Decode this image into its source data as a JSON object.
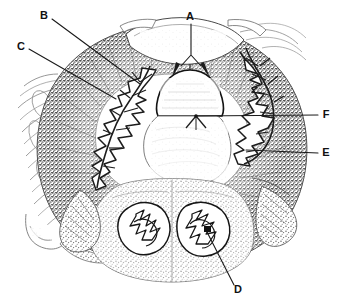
{
  "figure": {
    "kind": "labeled-histology-cross-section",
    "width": 344,
    "height": 308,
    "background_color": "#ffffff",
    "ink_color": "#1a1a1a",
    "caption": ""
  },
  "labels": [
    {
      "id": "A",
      "text": "A",
      "text_x": 190,
      "text_y": 17,
      "leader": "M191,24 L191,55 M191,55 L181,66 M191,55 L201,66",
      "points_to": "upper-midline-paired-structures"
    },
    {
      "id": "B",
      "text": "B",
      "text_x": 44,
      "text_y": 16,
      "leader": "M52,19 L140,84",
      "points_to": "left-branching-gland-upper"
    },
    {
      "id": "C",
      "text": "C",
      "text_x": 21,
      "text_y": 47,
      "leader": "M29,49 L116,99",
      "points_to": "left-branching-gland-lower"
    },
    {
      "id": "D",
      "text": "D",
      "text_x": 238,
      "text_y": 290,
      "leader": "M234,285 L207,232",
      "points_to": "right-lower-lobed-structure"
    },
    {
      "id": "E",
      "text": "E",
      "text_x": 326,
      "text_y": 153,
      "leader": "M318,153 L246,150",
      "points_to": "outer-dark-wall-right"
    },
    {
      "id": "F",
      "text": "F",
      "text_x": 326,
      "text_y": 115,
      "leader": "M318,115 L196,116",
      "points_to": "central-midline-junction"
    }
  ],
  "structures": [
    {
      "name": "outer-dark-ring",
      "description": "thick stippled dark annular wall"
    },
    {
      "name": "central-lumen",
      "description": "pale central cavity"
    },
    {
      "name": "central-dome",
      "description": "dome-shaped body on midline above lumen"
    },
    {
      "name": "upper-arch",
      "description": "pale crescent arch at top"
    },
    {
      "name": "left-fibrous-tissue",
      "description": "light streaky fibrous tissue at left periphery"
    },
    {
      "name": "left-branching-gland",
      "description": "white fern-like branching structure in left wall"
    },
    {
      "name": "right-branching-gland",
      "description": "white fern-like branching structure in right wall"
    },
    {
      "name": "lower-lobe-left",
      "description": "lower left lobed structure with branching core"
    },
    {
      "name": "lower-lobe-right",
      "description": "lower right lobed structure with branching core"
    }
  ]
}
